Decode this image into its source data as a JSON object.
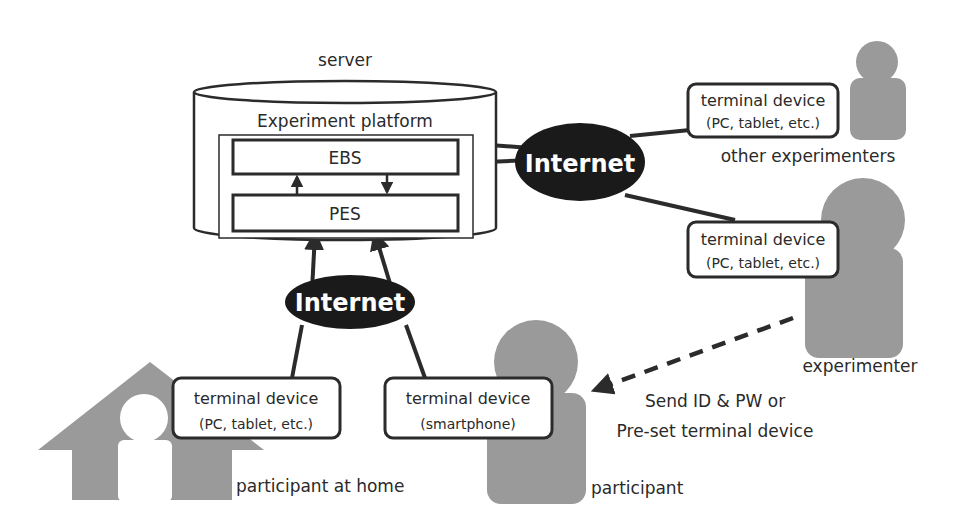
{
  "server": {
    "label": "server",
    "platform_label": "Experiment platform",
    "modules": [
      {
        "id": "ebs",
        "label": "EBS"
      },
      {
        "id": "pes",
        "label": "PES"
      }
    ]
  },
  "clouds": [
    {
      "id": "internet-top",
      "label": "Internet"
    },
    {
      "id": "internet-bottom",
      "label": "Internet"
    }
  ],
  "devices": [
    {
      "id": "device-other-experimenters",
      "line1": "terminal device",
      "line2": "(PC, tablet, etc.)"
    },
    {
      "id": "device-experimenter",
      "line1": "terminal device",
      "line2": "(PC, tablet, etc.)"
    },
    {
      "id": "device-home",
      "line1": "terminal device",
      "line2": "(PC, tablet, etc.)"
    },
    {
      "id": "device-smartphone",
      "line1": "terminal device",
      "line2": "(smartphone)"
    }
  ],
  "actors": [
    {
      "id": "other-experimenters",
      "label": "other experimenters"
    },
    {
      "id": "experimenter",
      "label": "experimenter"
    },
    {
      "id": "participant-at-home",
      "label": "participant at home"
    },
    {
      "id": "participant",
      "label": "participant"
    }
  ],
  "annotation": {
    "line1": "Send ID & PW or",
    "line2": "Pre-set terminal device"
  },
  "colors": {
    "stroke": "#2b2b2b",
    "actor_fill": "#9a9a9a",
    "cloud_fill": "#1a1a1a",
    "cloud_text": "#ffffff"
  }
}
